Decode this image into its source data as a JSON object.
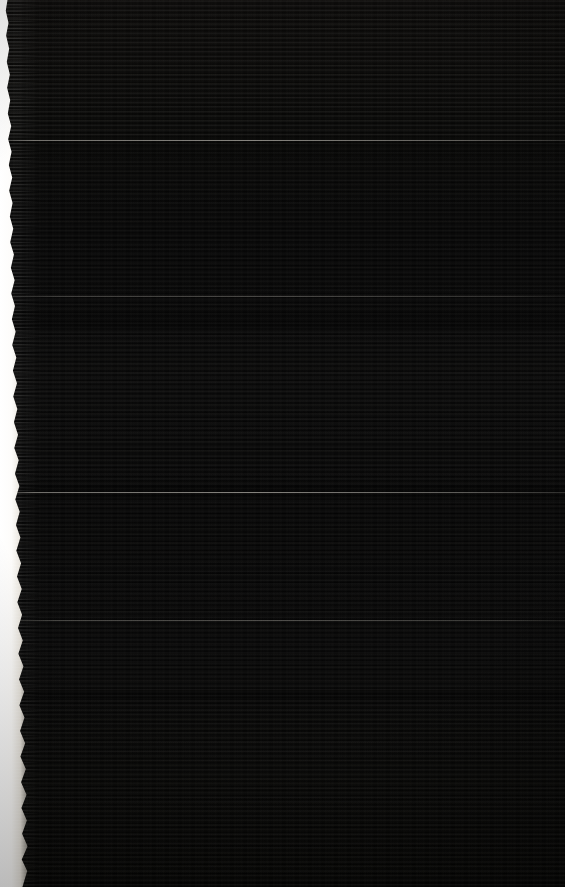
{
  "image": {
    "kind": "underexposed-photograph",
    "width": 565,
    "height": 887,
    "description": "Severely underexposed photograph of a dark, densely lined surface with a blown-out ragged highlight along the left edge",
    "readable_text": "none",
    "background_hex": "#050505",
    "highlight_hex": "#ffffff"
  },
  "regions": {
    "edge_highlight": {
      "name": "left-edge-blown-highlight",
      "x": 0,
      "y": 0,
      "width_top_px": 7,
      "width_mid_px": 12,
      "width_bottom_px": 22,
      "contour": "ragged / torn",
      "peak_hex": "#ffffff"
    },
    "text_field": {
      "name": "dense-scanline-field",
      "x": 22,
      "y": 0,
      "width": 543,
      "height": 887,
      "line_pitch_px": 4.6,
      "luminance_range": "0-25",
      "bleeds_to_edges": "top, right, bottom"
    }
  },
  "bands": [
    {
      "label": "upper-texture-band",
      "top": 0,
      "height": 138,
      "intensity": 0.62
    },
    {
      "label": "mid-upper-band",
      "top": 160,
      "height": 150,
      "intensity": 0.38
    },
    {
      "label": "mid-dense-band",
      "top": 330,
      "height": 155,
      "intensity": 0.78
    },
    {
      "label": "lower-dense-band",
      "top": 500,
      "height": 190,
      "intensity": 0.7
    },
    {
      "label": "bottom-band",
      "top": 700,
      "height": 187,
      "intensity": 0.55
    }
  ],
  "dividers": [
    {
      "label": "upper-divider",
      "top": 140,
      "strength": "strong"
    },
    {
      "label": "mid-divider",
      "top": 296,
      "strength": "soft"
    },
    {
      "label": "lower-divider",
      "top": 492,
      "strength": "strong"
    },
    {
      "label": "foot-divider",
      "top": 620,
      "strength": "soft"
    }
  ]
}
